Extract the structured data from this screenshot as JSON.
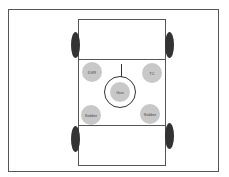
{
  "diagram": {
    "type": "vehicle-crew-layout",
    "seats": [
      {
        "id": "dvr",
        "label": "DVR"
      },
      {
        "id": "tc",
        "label": "TC"
      },
      {
        "id": "gun",
        "label": "Gun"
      },
      {
        "id": "soldier-left",
        "label": "Soldier"
      },
      {
        "id": "soldier-right",
        "label": "Soldier"
      }
    ],
    "colors": {
      "seat": "#c8c8c8",
      "wheel": "#333333",
      "line": "#555555"
    }
  }
}
